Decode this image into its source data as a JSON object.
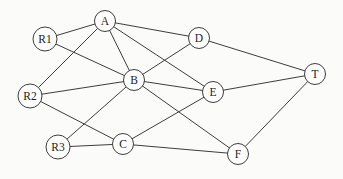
{
  "diagram": {
    "type": "undirected-graph",
    "background_color": "#fbfbf9",
    "edge_color": "#3d3d3d",
    "node_fill_color": "#ffffff",
    "node_stroke_color": "#3d3d3d",
    "label_color": "#1c1c1c",
    "default_node_radius": 10.5,
    "nodes": [
      {
        "id": "A",
        "label": "A",
        "x": 105,
        "y": 21,
        "r": 10.5
      },
      {
        "id": "R1",
        "label": "R1",
        "x": 45,
        "y": 39,
        "r": 12
      },
      {
        "id": "D",
        "label": "D",
        "x": 199,
        "y": 38,
        "r": 10.5
      },
      {
        "id": "T",
        "label": "T",
        "x": 315,
        "y": 74,
        "r": 10.5
      },
      {
        "id": "B",
        "label": "B",
        "x": 134,
        "y": 80,
        "r": 10.5
      },
      {
        "id": "E",
        "label": "E",
        "x": 213,
        "y": 92,
        "r": 10.5
      },
      {
        "id": "R2",
        "label": "R2",
        "x": 30,
        "y": 96,
        "r": 12
      },
      {
        "id": "C",
        "label": "C",
        "x": 123,
        "y": 144,
        "r": 10.5
      },
      {
        "id": "R3",
        "label": "R3",
        "x": 58,
        "y": 147,
        "r": 12
      },
      {
        "id": "F",
        "label": "F",
        "x": 238,
        "y": 154,
        "r": 10.5
      }
    ],
    "edges": [
      [
        "R1",
        "A"
      ],
      [
        "R1",
        "B"
      ],
      [
        "R2",
        "A"
      ],
      [
        "R2",
        "B"
      ],
      [
        "R2",
        "C"
      ],
      [
        "R3",
        "B"
      ],
      [
        "R3",
        "C"
      ],
      [
        "A",
        "B"
      ],
      [
        "A",
        "D"
      ],
      [
        "A",
        "E"
      ],
      [
        "B",
        "D"
      ],
      [
        "B",
        "E"
      ],
      [
        "B",
        "F"
      ],
      [
        "C",
        "E"
      ],
      [
        "C",
        "F"
      ],
      [
        "D",
        "T"
      ],
      [
        "E",
        "T"
      ],
      [
        "F",
        "T"
      ]
    ]
  }
}
